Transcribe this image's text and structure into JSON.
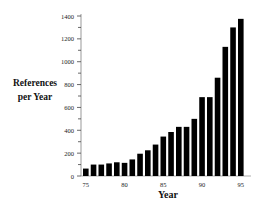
{
  "chart_data": {
    "type": "bar",
    "title": "",
    "xlabel": "Year",
    "ylabel": "References per Year",
    "ylabel_lines": [
      "References",
      "per Year"
    ],
    "categories": [
      "75",
      "76",
      "77",
      "78",
      "79",
      "80",
      "81",
      "82",
      "83",
      "84",
      "85",
      "86",
      "87",
      "88",
      "89",
      "90",
      "91",
      "92",
      "93",
      "94",
      "95"
    ],
    "values": [
      65,
      100,
      100,
      110,
      120,
      115,
      145,
      195,
      225,
      275,
      345,
      385,
      430,
      430,
      500,
      690,
      690,
      860,
      1130,
      1300,
      1375
    ],
    "x_tick_labels": [
      "75",
      "80",
      "85",
      "90",
      "95"
    ],
    "y_tick_labels": [
      "0",
      "200",
      "400",
      "600",
      "800",
      "1000",
      "1200",
      "1400"
    ],
    "ylim": [
      0,
      1400
    ],
    "y_major_step": 200,
    "y_minor_step": 100,
    "grid": false,
    "legend": null,
    "bar_color": "#000000"
  }
}
